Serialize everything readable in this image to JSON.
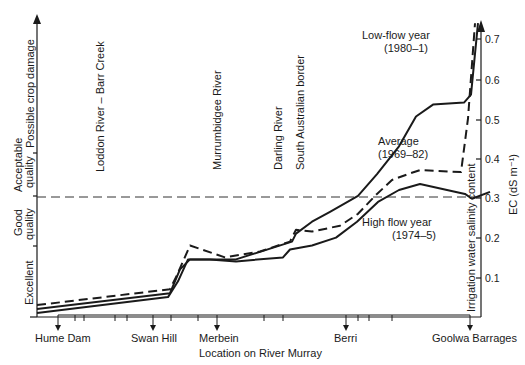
{
  "chart_data": {
    "type": "line",
    "title": "",
    "xlabel": "Location on River Murray",
    "ylabel": "Irrigation water salinity content",
    "ylabel_right_units": "EC (dS m⁻¹)",
    "ylim": [
      0,
      0.75
    ],
    "yticks": [
      0.1,
      0.2,
      0.3,
      0.4,
      0.5,
      0.6,
      0.7
    ],
    "ytick_labels": [
      "0.1",
      "0.2",
      "0.3",
      "0.4",
      "0.5",
      "0.6",
      "0.7"
    ],
    "x_locations": [
      {
        "name": "Hume Dam",
        "x": 58
      },
      {
        "name": "Swan Hill",
        "x": 153
      },
      {
        "name": "Merbein",
        "x": 217
      },
      {
        "name": "Berri",
        "x": 346
      },
      {
        "name": "Goolwa Barrages",
        "x": 470
      }
    ],
    "tributaries": [
      {
        "name": "Loddon River – Barr Creek",
        "x": 97
      },
      {
        "name": "Murrumbidgee River",
        "x": 216
      },
      {
        "name": "Darling River",
        "x": 306
      },
      {
        "name": "South Australian border",
        "x": 330
      }
    ],
    "quality_bands": [
      {
        "name": "Excellent",
        "from": 0,
        "to": 0.18
      },
      {
        "name": "Good quality",
        "from": 0.18,
        "to": 0.3
      },
      {
        "name": "Acceptable quality",
        "from": 0.3,
        "to": 0.41
      },
      {
        "name": "Possible crop damage",
        "from": 0.41,
        "to": 0.75
      }
    ],
    "threshold_line": 0.3,
    "series": [
      {
        "name": "Low-flow year (1980–1)",
        "style": "solid",
        "points": [
          [
            37,
            0.02
          ],
          [
            170,
            0.06
          ],
          [
            180,
            0.12
          ],
          [
            190,
            0.145
          ],
          [
            236,
            0.145
          ],
          [
            292,
            0.19
          ],
          [
            296,
            0.21
          ],
          [
            312,
            0.24
          ],
          [
            330,
            0.265
          ],
          [
            358,
            0.305
          ],
          [
            377,
            0.36
          ],
          [
            399,
            0.43
          ],
          [
            416,
            0.505
          ],
          [
            433,
            0.535
          ],
          [
            464,
            0.54
          ],
          [
            471,
            0.56
          ],
          [
            478,
            0.74
          ]
        ]
      },
      {
        "name": "Average (1969–82)",
        "style": "dashed",
        "points": [
          [
            37,
            0.03
          ],
          [
            170,
            0.07
          ],
          [
            176,
            0.1
          ],
          [
            190,
            0.18
          ],
          [
            225,
            0.15
          ],
          [
            260,
            0.165
          ],
          [
            290,
            0.19
          ],
          [
            296,
            0.22
          ],
          [
            312,
            0.215
          ],
          [
            340,
            0.23
          ],
          [
            358,
            0.26
          ],
          [
            377,
            0.31
          ],
          [
            392,
            0.345
          ],
          [
            408,
            0.36
          ],
          [
            420,
            0.37
          ],
          [
            461,
            0.365
          ],
          [
            468,
            0.5
          ],
          [
            475,
            0.74
          ]
        ]
      },
      {
        "name": "High flow year (1974–5)",
        "style": "solid",
        "points": [
          [
            37,
            0.01
          ],
          [
            168,
            0.05
          ],
          [
            178,
            0.09
          ],
          [
            188,
            0.145
          ],
          [
            210,
            0.145
          ],
          [
            236,
            0.14
          ],
          [
            283,
            0.15
          ],
          [
            290,
            0.17
          ],
          [
            312,
            0.18
          ],
          [
            336,
            0.2
          ],
          [
            357,
            0.24
          ],
          [
            378,
            0.29
          ],
          [
            399,
            0.32
          ],
          [
            420,
            0.335
          ],
          [
            465,
            0.31
          ],
          [
            472,
            0.298
          ],
          [
            490,
            0.315
          ]
        ]
      }
    ],
    "annotations": [
      {
        "text": "Low-flow year",
        "x": 365,
        "y": 40
      },
      {
        "text": "(1980–1)",
        "x": 378,
        "y": 52
      },
      {
        "text": "Average",
        "x": 378,
        "y": 144
      },
      {
        "text": "(1969–82)",
        "x": 378,
        "y": 157
      },
      {
        "text": "High flow year",
        "x": 362,
        "y": 226
      },
      {
        "text": "(1974–5)",
        "x": 378,
        "y": 239
      }
    ],
    "grid": false,
    "legend_position": "inline-annotations"
  },
  "labels": {
    "xlabel": "Location on River Murray",
    "ylabel": "Irrigation water salinity content",
    "ylabel_units": "EC (dS m⁻¹)",
    "band_excellent": "Excellent",
    "band_good_1": "Good",
    "band_good_2": "quality",
    "band_acceptable_1": "Acceptable",
    "band_acceptable_2": "quality",
    "band_damage": "Possible crop damage",
    "trib_loddon": "Loddon River – Barr Creek",
    "trib_murrumbidgee": "Murrumbidgee River",
    "trib_darling": "Darling River",
    "trib_sa_border": "South Australian border",
    "loc_hume": "Hume Dam",
    "loc_swan": "Swan Hill",
    "loc_merbein": "Merbein",
    "loc_berri": "Berri",
    "loc_goolwa": "Goolwa Barrages",
    "low_flow_1": "Low-flow year",
    "low_flow_2": "(1980–1)",
    "average_1": "Average",
    "average_2": "(1969–82)",
    "high_flow_1": "High flow year",
    "high_flow_2": "(1974–5)",
    "y01": "0.1",
    "y02": "0.2",
    "y03": "0.3",
    "y04": "0.4",
    "y05": "0.5",
    "y06": "0.6",
    "y07": "0.7"
  }
}
